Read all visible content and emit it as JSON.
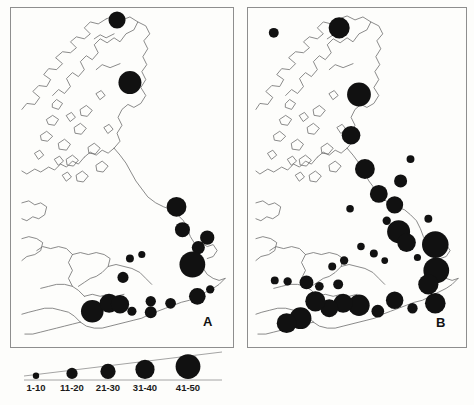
{
  "figure": {
    "panels": [
      {
        "id": "A",
        "label": "A"
      },
      {
        "id": "B",
        "label": "B"
      }
    ]
  },
  "legend": {
    "title": "",
    "classes": [
      {
        "label": "1-10",
        "radius": 3.2
      },
      {
        "label": "11-20",
        "radius": 5.6
      },
      {
        "label": "21-30",
        "radius": 7.6
      },
      {
        "label": "31-40",
        "radius": 9.6
      },
      {
        "label": "41-50",
        "radius": 12.4
      }
    ]
  },
  "chart_data": {
    "type": "scatter",
    "subtitle": "",
    "xlabel": "",
    "ylabel": "",
    "symbol_scale": {
      "units": "records per site",
      "bins": [
        "1-10",
        "11-20",
        "21-30",
        "31-40",
        "41-50"
      ],
      "radii_px": [
        3.2,
        5.6,
        7.6,
        9.6,
        12.4
      ]
    },
    "legend_position": "bottom-left",
    "grid": false,
    "panels": [
      {
        "name": "A",
        "label": "A",
        "point_count": 19,
        "points": [
          {
            "x": 118,
            "y": 20,
            "r": 8.6,
            "bin": "21-30"
          },
          {
            "x": 131,
            "y": 83,
            "r": 11.6,
            "bin": "31-40"
          },
          {
            "x": 178,
            "y": 208,
            "r": 10.0,
            "bin": "31-40"
          },
          {
            "x": 184,
            "y": 231,
            "r": 7.6,
            "bin": "21-30"
          },
          {
            "x": 200,
            "y": 249,
            "r": 6.6,
            "bin": "11-20"
          },
          {
            "x": 209,
            "y": 239,
            "r": 7.2,
            "bin": "21-30"
          },
          {
            "x": 194,
            "y": 266,
            "r": 13.0,
            "bin": "41-50"
          },
          {
            "x": 131,
            "y": 260,
            "r": 4.0,
            "bin": "1-10"
          },
          {
            "x": 143,
            "y": 256,
            "r": 3.6,
            "bin": "1-10"
          },
          {
            "x": 124,
            "y": 279,
            "r": 5.6,
            "bin": "11-20"
          },
          {
            "x": 93,
            "y": 313,
            "r": 11.4,
            "bin": "31-40"
          },
          {
            "x": 110,
            "y": 305,
            "r": 9.6,
            "bin": "31-40"
          },
          {
            "x": 121,
            "y": 306,
            "r": 9.2,
            "bin": "31-40"
          },
          {
            "x": 133,
            "y": 313,
            "r": 4.6,
            "bin": "1-10"
          },
          {
            "x": 152,
            "y": 303,
            "r": 5.2,
            "bin": "11-20"
          },
          {
            "x": 152,
            "y": 314,
            "r": 6.0,
            "bin": "11-20"
          },
          {
            "x": 172,
            "y": 305,
            "r": 5.4,
            "bin": "11-20"
          },
          {
            "x": 199,
            "y": 298,
            "r": 8.4,
            "bin": "21-30"
          },
          {
            "x": 212,
            "y": 291,
            "r": 4.2,
            "bin": "1-10"
          }
        ]
      },
      {
        "name": "B",
        "label": "B",
        "point_count": 38,
        "points": [
          {
            "x": 274,
            "y": 33,
            "r": 5.0,
            "bin": "11-20"
          },
          {
            "x": 340,
            "y": 28,
            "r": 10.6,
            "bin": "31-40"
          },
          {
            "x": 360,
            "y": 95,
            "r": 12.0,
            "bin": "41-50"
          },
          {
            "x": 352,
            "y": 136,
            "r": 9.4,
            "bin": "31-40"
          },
          {
            "x": 366,
            "y": 170,
            "r": 10.0,
            "bin": "31-40"
          },
          {
            "x": 380,
            "y": 195,
            "r": 9.0,
            "bin": "21-30"
          },
          {
            "x": 388,
            "y": 222,
            "r": 4.2,
            "bin": "1-10"
          },
          {
            "x": 402,
            "y": 182,
            "r": 6.6,
            "bin": "11-20"
          },
          {
            "x": 396,
            "y": 206,
            "r": 8.6,
            "bin": "21-30"
          },
          {
            "x": 400,
            "y": 233,
            "r": 11.6,
            "bin": "41-50"
          },
          {
            "x": 408,
            "y": 244,
            "r": 9.4,
            "bin": "31-40"
          },
          {
            "x": 437,
            "y": 246,
            "r": 13.4,
            "bin": "41-50"
          },
          {
            "x": 438,
            "y": 272,
            "r": 13.0,
            "bin": "41-50"
          },
          {
            "x": 430,
            "y": 286,
            "r": 10.2,
            "bin": "31-40"
          },
          {
            "x": 437,
            "y": 305,
            "r": 10.4,
            "bin": "31-40"
          },
          {
            "x": 414,
            "y": 310,
            "r": 5.2,
            "bin": "11-20"
          },
          {
            "x": 396,
            "y": 302,
            "r": 8.8,
            "bin": "21-30"
          },
          {
            "x": 379,
            "y": 313,
            "r": 6.4,
            "bin": "11-20"
          },
          {
            "x": 360,
            "y": 307,
            "r": 10.8,
            "bin": "31-40"
          },
          {
            "x": 344,
            "y": 305,
            "r": 9.6,
            "bin": "31-40"
          },
          {
            "x": 330,
            "y": 310,
            "r": 9.0,
            "bin": "21-30"
          },
          {
            "x": 316,
            "y": 303,
            "r": 10.2,
            "bin": "31-40"
          },
          {
            "x": 301,
            "y": 320,
            "r": 11.0,
            "bin": "31-40"
          },
          {
            "x": 287,
            "y": 325,
            "r": 10.0,
            "bin": "31-40"
          },
          {
            "x": 339,
            "y": 286,
            "r": 5.0,
            "bin": "11-20"
          },
          {
            "x": 320,
            "y": 288,
            "r": 4.4,
            "bin": "1-10"
          },
          {
            "x": 307,
            "y": 284,
            "r": 7.0,
            "bin": "11-20"
          },
          {
            "x": 288,
            "y": 283,
            "r": 4.2,
            "bin": "1-10"
          },
          {
            "x": 275,
            "y": 282,
            "r": 4.0,
            "bin": "1-10"
          },
          {
            "x": 333,
            "y": 268,
            "r": 4.0,
            "bin": "1-10"
          },
          {
            "x": 345,
            "y": 262,
            "r": 4.2,
            "bin": "1-10"
          },
          {
            "x": 362,
            "y": 248,
            "r": 3.8,
            "bin": "1-10"
          },
          {
            "x": 375,
            "y": 255,
            "r": 4.0,
            "bin": "1-10"
          },
          {
            "x": 386,
            "y": 262,
            "r": 3.4,
            "bin": "1-10"
          },
          {
            "x": 419,
            "y": 259,
            "r": 3.6,
            "bin": "1-10"
          },
          {
            "x": 430,
            "y": 220,
            "r": 4.0,
            "bin": "1-10"
          },
          {
            "x": 351,
            "y": 210,
            "r": 3.8,
            "bin": "1-10"
          },
          {
            "x": 412,
            "y": 160,
            "r": 4.0,
            "bin": "1-10"
          }
        ]
      }
    ]
  },
  "colors": {
    "symbol": "#111111",
    "coastline": "#6d6d6d",
    "frame": "#8e8e8e",
    "background": "#fdfdfb",
    "text": "#1a1a1a"
  }
}
